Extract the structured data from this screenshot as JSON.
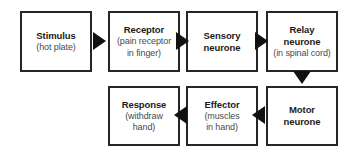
{
  "diagram": {
    "type": "flowchart",
    "orientation": "snake-left-to-right-then-right-to-left",
    "colors": {
      "box_border": "#262626",
      "box_fill": "#ffffff",
      "arrow_fill": "#111111",
      "title_text": "#1b1b1b",
      "sub_text": "#4a4a4a",
      "background": "#ffffff"
    },
    "nodes": [
      {
        "id": "stimulus",
        "title": "Stimulus",
        "sub_lines": [
          "(hot plate)"
        ],
        "row": 1,
        "column": 1
      },
      {
        "id": "receptor",
        "title": "Receptor",
        "sub_lines": [
          "(pain receptor",
          "in finger)"
        ],
        "row": 1,
        "column": 2
      },
      {
        "id": "sensory_neurone",
        "title_lines": [
          "Sensory",
          "neurone"
        ],
        "sub_lines": [],
        "row": 1,
        "column": 3
      },
      {
        "id": "relay_neurone",
        "title_lines": [
          "Relay",
          "neurone"
        ],
        "sub_lines": [
          "(in spinal cord)"
        ],
        "row": 1,
        "column": 4
      },
      {
        "id": "motor_neurone",
        "title_lines": [
          "Motor",
          "neurone"
        ],
        "sub_lines": [],
        "row": 2,
        "column": 4
      },
      {
        "id": "effector",
        "title": "Effector",
        "sub_lines": [
          "(muscles",
          "in hand)"
        ],
        "row": 2,
        "column": 3
      },
      {
        "id": "response",
        "title": "Response",
        "sub_lines": [
          "(withdraw",
          "hand)"
        ],
        "row": 2,
        "column": 2
      }
    ],
    "edges": [
      {
        "id": "stimulus-receptor",
        "from": "stimulus",
        "to": "receptor",
        "direction": "right"
      },
      {
        "id": "receptor-sensory",
        "from": "receptor",
        "to": "sensory_neurone",
        "direction": "right"
      },
      {
        "id": "sensory-relay",
        "from": "sensory_neurone",
        "to": "relay_neurone",
        "direction": "right"
      },
      {
        "id": "relay-motor",
        "from": "relay_neurone",
        "to": "motor_neurone",
        "direction": "down"
      },
      {
        "id": "motor-effector",
        "from": "motor_neurone",
        "to": "effector",
        "direction": "left"
      },
      {
        "id": "effector-response",
        "from": "effector",
        "to": "response",
        "direction": "left"
      }
    ]
  }
}
